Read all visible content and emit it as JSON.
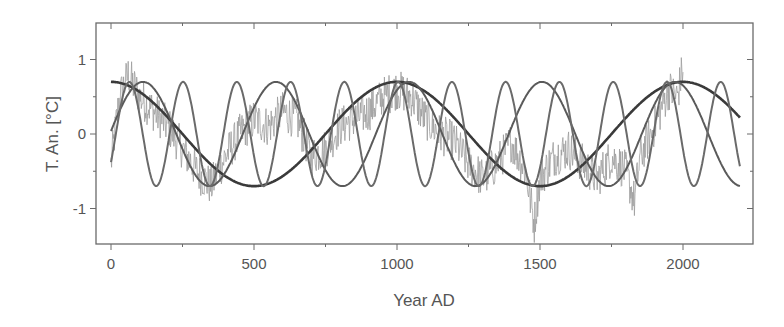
{
  "chart_data": {
    "type": "line",
    "title": "",
    "xlabel": "Year AD",
    "ylabel": "T. An. [°C]",
    "xlim": [
      -50,
      2245
    ],
    "ylim": [
      -1.48,
      1.49
    ],
    "xticks": [
      0,
      500,
      1000,
      1500,
      2000
    ],
    "xtick_labels": [
      "0",
      "500",
      "1000",
      "1500",
      "2000"
    ],
    "xminor_ticks": [
      250,
      750,
      1250,
      1750
    ],
    "yticks": [
      -1,
      0,
      1
    ],
    "ytick_labels": [
      "-1",
      "0",
      "1"
    ],
    "yminor_ticks": [
      -1.5,
      -0.5,
      0.5,
      1.5
    ],
    "grid": false,
    "legend": null,
    "series": [
      {
        "name": "temperature reconstruction (noisy)",
        "style": "thin light gray",
        "color": "#9a9a9a",
        "x_range": [
          0,
          2000
        ],
        "description": "noisy anomaly record, roughly -1.3 to 1.1 °C, tracking the sum of the cycles",
        "approx_points": [
          [
            0,
            -0.4
          ],
          [
            30,
            0.5
          ],
          [
            60,
            0.8
          ],
          [
            100,
            0.5
          ],
          [
            150,
            0.3
          ],
          [
            200,
            0.1
          ],
          [
            250,
            -0.2
          ],
          [
            300,
            -0.5
          ],
          [
            350,
            -0.7
          ],
          [
            400,
            -0.3
          ],
          [
            450,
            0.0
          ],
          [
            500,
            0.2
          ],
          [
            550,
            0.1
          ],
          [
            600,
            0.3
          ],
          [
            650,
            0.2
          ],
          [
            700,
            -0.3
          ],
          [
            750,
            -0.2
          ],
          [
            800,
            0.1
          ],
          [
            850,
            0.2
          ],
          [
            900,
            0.3
          ],
          [
            950,
            0.5
          ],
          [
            1000,
            0.6
          ],
          [
            1050,
            0.5
          ],
          [
            1100,
            0.2
          ],
          [
            1150,
            0.0
          ],
          [
            1200,
            -0.1
          ],
          [
            1250,
            -0.4
          ],
          [
            1300,
            -0.6
          ],
          [
            1350,
            -0.4
          ],
          [
            1400,
            -0.1
          ],
          [
            1450,
            -0.5
          ],
          [
            1480,
            -1.2
          ],
          [
            1500,
            -0.6
          ],
          [
            1550,
            -0.3
          ],
          [
            1600,
            -0.2
          ],
          [
            1650,
            -0.4
          ],
          [
            1700,
            -0.6
          ],
          [
            1750,
            -0.3
          ],
          [
            1800,
            -0.5
          ],
          [
            1830,
            -0.9
          ],
          [
            1850,
            -0.3
          ],
          [
            1900,
            0.1
          ],
          [
            1950,
            0.6
          ],
          [
            1980,
            0.5
          ],
          [
            2000,
            0.9
          ]
        ]
      },
      {
        "name": "~1000-yr cycle",
        "style": "thick dark",
        "color": "#3a3a3a",
        "amplitude": 0.7,
        "period": 1000,
        "phase_peak_year": 0,
        "x_range": [
          0,
          2200
        ]
      },
      {
        "name": "~460-yr cycle",
        "style": "medium gray",
        "color": "#5a5a5a",
        "amplitude": 0.7,
        "period": 465,
        "phase_peak_year": 112,
        "x_range": [
          0,
          2200
        ]
      },
      {
        "name": "~190-yr cycle",
        "style": "medium gray",
        "color": "#6a6a6a",
        "amplitude": 0.7,
        "period": 188,
        "phase_peak_year": 252,
        "x_range": [
          0,
          2200
        ]
      }
    ]
  },
  "plot": {
    "frame": {
      "left": 96,
      "top": 23,
      "right": 753,
      "bottom": 244
    },
    "frame_color": "#6a6a6a",
    "text_color": "#555555"
  }
}
